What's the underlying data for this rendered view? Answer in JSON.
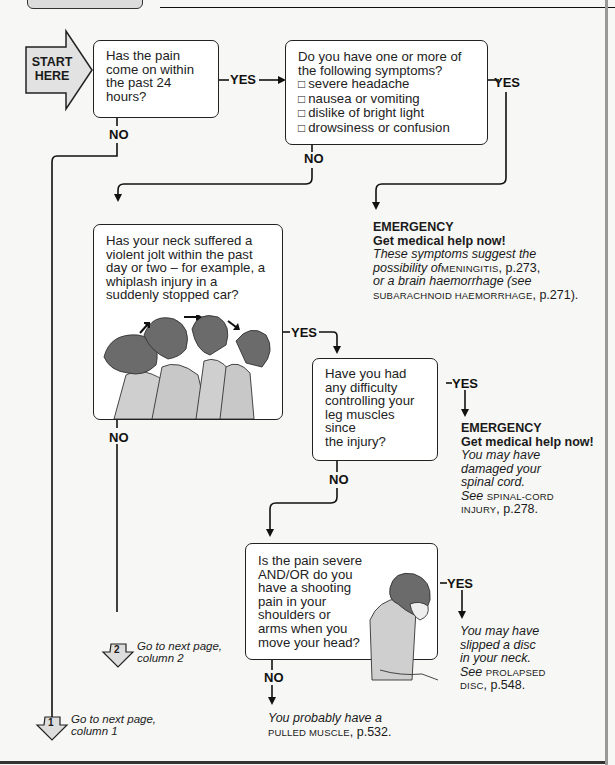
{
  "header": {
    "tab_label": ""
  },
  "start": {
    "label_line1": "START",
    "label_line2": "HERE"
  },
  "q1": {
    "text": [
      "Has the pain",
      "come on within",
      "the past 24",
      "hours?"
    ],
    "yes": "YES",
    "no": "NO"
  },
  "q2": {
    "intro": [
      "Do you have one or more of",
      "the following symptoms?"
    ],
    "symptoms": [
      "severe headache",
      "nausea or vomiting",
      "dislike of bright light",
      "drowsiness or confusion"
    ],
    "yes": "YES",
    "no": "NO"
  },
  "outcome_meningitis": {
    "title": "EMERGENCY",
    "subtitle": "Get medical help now!",
    "line1": "These symptoms suggest the",
    "line2_it": "possibility of",
    "line2_sc": "MENINGITIS",
    "line2_pg": ", p.273,",
    "line3": "or a brain haemorrhage (see",
    "line4_sc": "SUBARACHNOID HAEMORRHAGE",
    "line4_pg": ", p.271)."
  },
  "q3": {
    "text": [
      "Has your neck suffered a",
      "violent jolt within the past",
      "day or two – for example, a",
      "whiplash injury in a",
      "suddenly stopped car?"
    ],
    "illustration": "whiplash-sequence",
    "yes": "YES",
    "no": "NO"
  },
  "q4": {
    "text": [
      "Have you had",
      "any difficulty",
      "controlling your",
      "leg muscles",
      "since",
      "the injury?"
    ],
    "yes": "YES",
    "no": "NO"
  },
  "outcome_spinal": {
    "title": "EMERGENCY",
    "subtitle": "Get medical help now!",
    "line1": "You may have",
    "line2": "damaged your",
    "line3": "spinal cord.",
    "line4_it": "See ",
    "line4_sc": "SPINAL-CORD",
    "line5_sc": "INJURY",
    "line5_pg": ", p.278."
  },
  "q5": {
    "text": [
      "Is the pain severe",
      "AND/OR do you",
      "have a shooting",
      "pain in your",
      "shoulders or",
      "arms when you",
      "move your head?"
    ],
    "illustration": "person-bending-head",
    "yes": "YES",
    "no": "NO"
  },
  "outcome_disc": {
    "line1": "You may have",
    "line2": "slipped a disc",
    "line3": "in your neck.",
    "line4_it": "See ",
    "line4_sc": "PROLAPSED",
    "line5_sc": "DISC",
    "line5_pg": ", p.548."
  },
  "outcome_muscle": {
    "line1": "You probably have a",
    "line2_sc": "PULLED MUSCLE",
    "line2_pg": ", p.532."
  },
  "goto2": {
    "number": "2",
    "line1": "Go to next page,",
    "line2": "column 2"
  },
  "goto1": {
    "number": "1",
    "line1": "Go to next page,",
    "line2": "column 1"
  },
  "colors": {
    "box_fill": "#ffffff",
    "line": "#111111",
    "start_fill": "#e2e2e2",
    "figure_hair": "#6b6b6b",
    "figure_shirt": "#c8c8c8"
  }
}
